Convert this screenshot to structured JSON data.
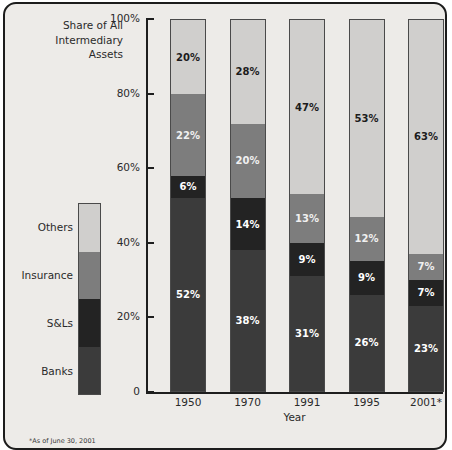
{
  "chart_data": {
    "type": "bar",
    "subtype": "stacked-100-percent",
    "title": "",
    "ylabel": "Share of All Intermediary Assets",
    "xlabel": "Year",
    "categories": [
      "1950",
      "1970",
      "1991",
      "1995",
      "2001*"
    ],
    "ylim": [
      0,
      100
    ],
    "ytick_labels": [
      "100%",
      "80%",
      "60%",
      "40%",
      "20%",
      "0"
    ],
    "ytick_values": [
      100,
      80,
      60,
      40,
      20,
      0
    ],
    "grid": false,
    "legend_position": "left",
    "series": [
      {
        "name": "Banks",
        "color": "#3b3b3b",
        "values": [
          52,
          38,
          31,
          26,
          23
        ],
        "labels": [
          "52%",
          "38%",
          "31%",
          "26%",
          "23%"
        ],
        "label_color": "#ffffff"
      },
      {
        "name": "S&Ls",
        "color": "#232323",
        "values": [
          6,
          14,
          9,
          9,
          7
        ],
        "labels": [
          "6%",
          "14%",
          "9%",
          "9%",
          "7%"
        ],
        "label_color": "#ffffff"
      },
      {
        "name": "Insurance",
        "color": "#7d7d7d",
        "values": [
          22,
          20,
          13,
          12,
          7
        ],
        "labels": [
          "22%",
          "20%",
          "13%",
          "12%",
          "7%"
        ],
        "label_color": "#f0f0f0"
      },
      {
        "name": "Others",
        "color": "#d0cfcd",
        "values": [
          20,
          28,
          47,
          53,
          63
        ],
        "labels": [
          "20%",
          "28%",
          "47%",
          "53%",
          "63%"
        ],
        "label_color": "#1c1c1c"
      }
    ],
    "footnote": "*As of June 30, 2001"
  },
  "axis_title": {
    "line1": "Share of All",
    "line2": "Intermediary",
    "line3": "Assets"
  },
  "legend": {
    "items": [
      {
        "label": "Others",
        "color": "#d0cfcd"
      },
      {
        "label": "Insurance",
        "color": "#7d7d7d"
      },
      {
        "label": "S&Ls",
        "color": "#232323"
      },
      {
        "label": "Banks",
        "color": "#3b3b3b"
      }
    ]
  },
  "colors": {
    "panel_background": "#edebe8",
    "panel_border": "#1c1c1c",
    "axis": "#1e1e1e",
    "text": "#2a2a2a"
  }
}
